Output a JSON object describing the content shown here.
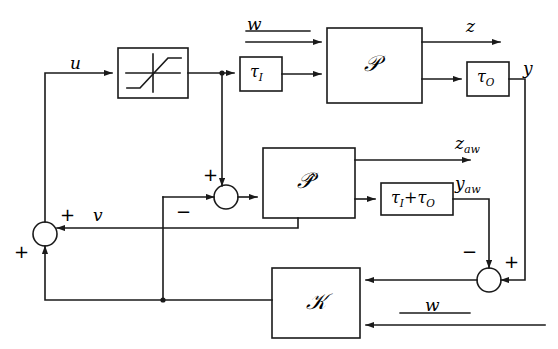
{
  "diagram": {
    "stroke_color": "#1a1a1a",
    "background": "#ffffff",
    "blocks": [
      {
        "id": "saturation",
        "label": "",
        "icon": "saturation-nonlinearity-icon",
        "x": 118,
        "y": 48,
        "w": 70,
        "h": 50
      },
      {
        "id": "tau_i",
        "label": "τ",
        "sub": "I",
        "x": 240,
        "y": 57,
        "w": 42,
        "h": 34
      },
      {
        "id": "plant",
        "label": "𝒫",
        "x": 327,
        "y": 28,
        "w": 95,
        "h": 75
      },
      {
        "id": "tau_o",
        "label": "τ",
        "sub": "O",
        "x": 467,
        "y": 62,
        "w": 42,
        "h": 34
      },
      {
        "id": "plant_hat",
        "label": "𝒫̂",
        "x": 263,
        "y": 148,
        "w": 92,
        "h": 70
      },
      {
        "id": "tau_sum",
        "label": "τ",
        "sub": "I",
        "label2": "+τ",
        "sub2": "O",
        "x": 381,
        "y": 183,
        "w": 72,
        "h": 32
      },
      {
        "id": "controller",
        "label": "𝒦",
        "x": 272,
        "y": 268,
        "w": 88,
        "h": 70
      }
    ],
    "summing_junctions": [
      {
        "id": "sum-left",
        "cx": 45,
        "cy": 234,
        "r": 12,
        "signs": [
          {
            "text": "+",
            "pos": "top-right"
          },
          {
            "text": "+",
            "pos": "bottom-left"
          }
        ]
      },
      {
        "id": "sum-middle",
        "cx": 226,
        "cy": 197,
        "r": 12,
        "signs": [
          {
            "text": "+",
            "pos": "top-left"
          },
          {
            "text": "−",
            "pos": "bottom-left"
          }
        ]
      },
      {
        "id": "sum-right",
        "cx": 489,
        "cy": 280,
        "r": 12,
        "signs": [
          {
            "text": "−",
            "pos": "top-left"
          },
          {
            "text": "+",
            "pos": "top-right"
          }
        ]
      }
    ],
    "signals": [
      {
        "id": "u",
        "text": "u",
        "x": 70,
        "y": 55
      },
      {
        "id": "w-top",
        "text": "w",
        "x": 247,
        "y": 18
      },
      {
        "id": "z",
        "text": "z",
        "x": 466,
        "y": 18
      },
      {
        "id": "y",
        "text": "y",
        "x": 523,
        "y": 60
      },
      {
        "id": "z-aw",
        "text": "z",
        "sub": "aw",
        "x": 466,
        "y": 135
      },
      {
        "id": "y-aw",
        "text": "y",
        "sub": "aw",
        "x": 460,
        "y": 178
      },
      {
        "id": "v",
        "text": "v",
        "x": 93,
        "y": 208
      },
      {
        "id": "w-bottom",
        "text": "w",
        "x": 448,
        "y": 298
      }
    ]
  }
}
